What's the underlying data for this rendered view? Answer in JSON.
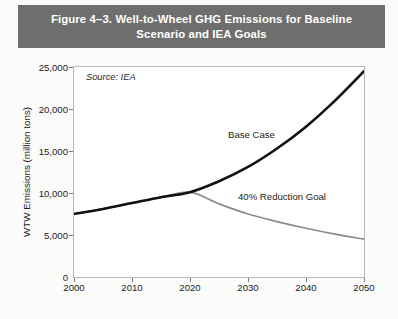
{
  "figure": {
    "title": "Figure 4–3.  Well-to-Wheel GHG Emissions for Baseline Scenario and IEA Goals",
    "banner_color": "#6e6e6e",
    "page_background": "#fbfbfa"
  },
  "chart_data": {
    "type": "line",
    "title": "Figure 4–3.  Well-to-Wheel GHG Emissions for Baseline Scenario and IEA Goals",
    "xlabel": "",
    "ylabel": "WTW Emissions (million tons)",
    "xlim": [
      2000,
      2050
    ],
    "ylim": [
      0,
      25000
    ],
    "xticks": [
      2000,
      2010,
      2020,
      2030,
      2040,
      2050
    ],
    "xtick_labels": [
      "2000",
      "2010",
      "2020",
      "2030",
      "2040",
      "2050"
    ],
    "yticks": [
      0,
      5000,
      10000,
      15000,
      20000,
      25000
    ],
    "ytick_labels": [
      "0",
      "5,000",
      "10,000",
      "15,000",
      "20,000",
      "25,000"
    ],
    "grid": false,
    "legend": "none",
    "x": [
      2000,
      2005,
      2010,
      2015,
      2020,
      2025,
      2030,
      2035,
      2040,
      2045,
      2050
    ],
    "series": [
      {
        "name": "Base Case",
        "color": "#111111",
        "line_width": 2.6,
        "values": [
          7500,
          8100,
          8800,
          9500,
          10100,
          11400,
          13100,
          15300,
          17900,
          21000,
          24500
        ]
      },
      {
        "name": "40% Reduction Goal",
        "color": "#8c8c8c",
        "line_width": 1.7,
        "values": [
          7500,
          8100,
          8800,
          9500,
          10100,
          8700,
          7500,
          6600,
          5800,
          5100,
          4500
        ]
      }
    ],
    "annotations": [
      {
        "name": "source-note",
        "text": "Source: IEA",
        "x": 2002,
        "y": 23600,
        "italic": true
      },
      {
        "name": "base-case-label",
        "text": "Base Case",
        "x": 2027,
        "y": 17400,
        "italic": false
      },
      {
        "name": "reduction-goal-label",
        "text": "40% Reduction Goal",
        "x": 2029,
        "y": 10150,
        "italic": false
      }
    ]
  }
}
